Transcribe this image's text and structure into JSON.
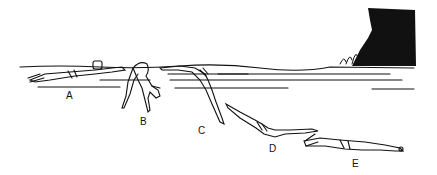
{
  "figure": {
    "background": "#ffffff",
    "ink": "#111111",
    "labels": [
      {
        "id": "A",
        "text": "A",
        "x": 66,
        "y": 90
      },
      {
        "id": "B",
        "text": "B",
        "x": 140,
        "y": 116
      },
      {
        "id": "C",
        "text": "C",
        "x": 198,
        "y": 125
      },
      {
        "id": "D",
        "text": "D",
        "x": 269,
        "y": 143
      },
      {
        "id": "E",
        "text": "E",
        "x": 352,
        "y": 158
      }
    ],
    "elements": [
      "water-surface",
      "wall-wave-splash",
      "swimmer-A",
      "swimmer-B",
      "swimmer-C",
      "swimmer-D",
      "swimmer-E"
    ]
  }
}
